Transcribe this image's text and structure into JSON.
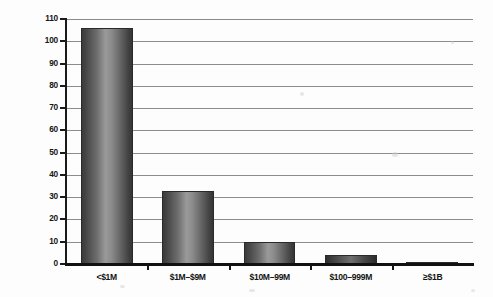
{
  "chart_data": {
    "type": "bar",
    "title": "",
    "subtitle": "",
    "xlabel": "",
    "ylabel": "",
    "categories": [
      "<$1M",
      "$1M–$9M",
      "$10M–99M",
      "$100–999M",
      "≥$1B"
    ],
    "values": [
      106,
      33,
      10,
      4,
      0.5
    ],
    "ylim": [
      0,
      110
    ],
    "ytick_step": 10,
    "ytick_labels": [
      "0",
      "10",
      "20",
      "30",
      "40",
      "50",
      "60",
      "70",
      "80",
      "90",
      "100",
      "110"
    ],
    "grid": true,
    "grid_axis": "y",
    "legend": false,
    "legend_position": "none",
    "series": [
      {
        "name": "count",
        "values": [
          106,
          33,
          10,
          4,
          0.5
        ]
      }
    ],
    "colors": {
      "bar_dark": "#3a3a3a",
      "bar_light": "#9a9a9a",
      "gridline": "#8c8c8c",
      "axis": "#141414",
      "text": "#141414",
      "background": "#fdfdfd"
    }
  }
}
